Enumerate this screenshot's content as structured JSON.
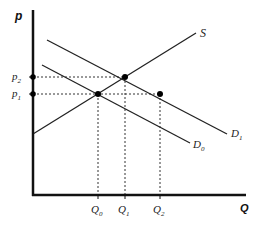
{
  "diagram": {
    "type": "supply-demand",
    "axes": {
      "y_label": "p",
      "x_label": "Q"
    },
    "curves": [
      {
        "id": "S",
        "label": "S",
        "x1": 33,
        "y1": 134,
        "x2": 196,
        "y2": 33
      },
      {
        "id": "D1",
        "label": "D",
        "sub": "1",
        "x1": 47,
        "y1": 40,
        "x2": 227,
        "y2": 134
      },
      {
        "id": "D0",
        "label": "D",
        "sub": "0",
        "x1": 42,
        "y1": 65,
        "x2": 190,
        "y2": 143
      }
    ],
    "price_levels": [
      {
        "label": "p",
        "sub": "2",
        "y": 77
      },
      {
        "label": "p",
        "sub": "1",
        "y": 94
      }
    ],
    "quantity_levels": [
      {
        "label": "Q",
        "sub": "0",
        "x": 98
      },
      {
        "label": "Q",
        "sub": "1",
        "x": 125
      },
      {
        "label": "Q",
        "sub": "2",
        "x": 160
      }
    ],
    "points": [
      {
        "name": "equilibrium-S-D0",
        "x": 98,
        "y": 94
      },
      {
        "name": "equilibrium-S-D1",
        "x": 125,
        "y": 77
      },
      {
        "name": "D1-at-p1",
        "x": 160,
        "y": 94
      }
    ],
    "labels": {
      "S": "S",
      "D1_main": "D",
      "D1_sub": "1",
      "D0_main": "D",
      "D0_sub": "0",
      "p2_main": "p",
      "p2_sub": "2",
      "p1_main": "p",
      "p1_sub": "1",
      "Q0_main": "Q",
      "Q0_sub": "0",
      "Q1_main": "Q",
      "Q1_sub": "1",
      "Q2_main": "Q",
      "Q2_sub": "2",
      "y_axis": "p",
      "x_axis": "Q"
    }
  }
}
